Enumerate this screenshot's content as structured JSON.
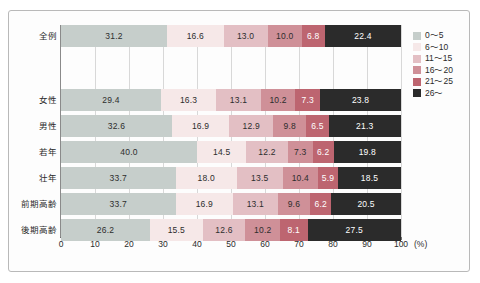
{
  "chart_data": {
    "type": "bar",
    "orientation": "horizontal",
    "stacked": true,
    "normalized_percent": true,
    "title": "",
    "xlabel": "(%)",
    "ylabel": "",
    "xlim": [
      0,
      100
    ],
    "xticks": [
      0,
      10,
      20,
      30,
      40,
      50,
      60,
      70,
      80,
      90,
      100
    ],
    "xticklabels": [
      "0",
      "10",
      "20",
      "30",
      "40",
      "50",
      "60",
      "70",
      "80",
      "90",
      "100"
    ],
    "grid": true,
    "grid_axis": "x",
    "legend_position": "right",
    "categories": [
      "全例",
      "女性",
      "男性",
      "若年",
      "壮年",
      "前期高齢",
      "後期高齢"
    ],
    "series": [
      {
        "name": "0〜5",
        "color": "#c6cecb",
        "values": [
          31.2,
          29.4,
          32.6,
          40.0,
          33.7,
          33.7,
          26.2
        ]
      },
      {
        "name": "6〜10",
        "color": "#f6e8e8",
        "values": [
          16.6,
          16.3,
          16.9,
          14.5,
          18.0,
          16.9,
          15.5
        ]
      },
      {
        "name": "11〜15",
        "color": "#e3bfc4",
        "values": [
          13.0,
          13.1,
          12.9,
          12.2,
          13.5,
          13.1,
          12.6
        ]
      },
      {
        "name": "16〜20",
        "color": "#cf9098",
        "values": [
          10.0,
          10.2,
          9.8,
          7.3,
          10.4,
          9.6,
          10.2
        ]
      },
      {
        "name": "21〜25",
        "color": "#bd6570",
        "values": [
          6.8,
          7.3,
          6.5,
          6.2,
          5.9,
          6.2,
          8.1
        ]
      },
      {
        "name": "26〜",
        "color": "#2b2b2b",
        "values": [
          22.4,
          23.8,
          21.3,
          19.8,
          18.5,
          20.5,
          27.5
        ]
      }
    ],
    "value_label_format": "one-decimal",
    "label_text_colors": [
      "#2d2d2d",
      "#2d2d2d",
      "#2d2d2d",
      "#2d2d2d",
      "#ffffff",
      "#ffffff"
    ]
  },
  "legend": {
    "items": [
      {
        "label": "0〜5",
        "color": "#c6cecb"
      },
      {
        "label": "6〜10",
        "color": "#f6e8e8"
      },
      {
        "label": "11〜15",
        "color": "#e3bfc4"
      },
      {
        "label": "16〜20",
        "color": "#cf9098"
      },
      {
        "label": "21〜25",
        "color": "#bd6570"
      },
      {
        "label": "26〜",
        "color": "#2b2b2b"
      }
    ]
  },
  "axis": {
    "percent_label": "(%)"
  }
}
